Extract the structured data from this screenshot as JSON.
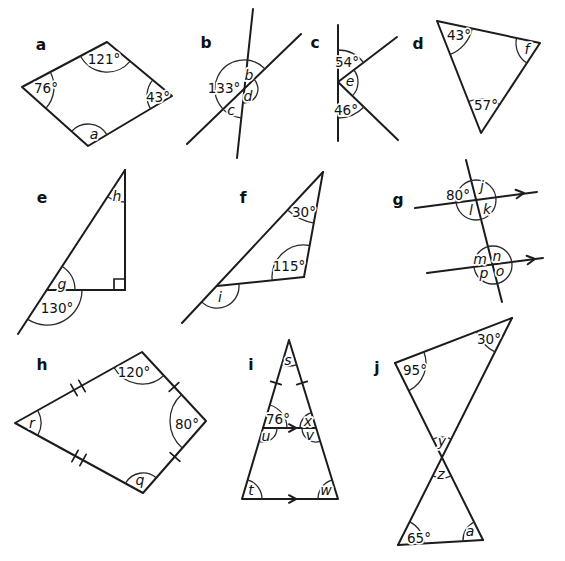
{
  "colors": {
    "ink": "#1c1c1c",
    "background": "#ffffff"
  },
  "figures": {
    "a": {
      "label": "a",
      "angles": {
        "top": "121°",
        "left": "76°",
        "right": "43°",
        "bottom": "a"
      }
    },
    "b": {
      "label": "b",
      "angles": {
        "top": "b",
        "left": "133°",
        "right": "d",
        "bottom": "c"
      }
    },
    "c": {
      "label": "c",
      "angles": {
        "top": "54°",
        "middle": "e",
        "bottom": "46°"
      }
    },
    "d": {
      "label": "d",
      "angles": {
        "top_left": "43°",
        "right": "f",
        "bottom": "57°"
      }
    },
    "e": {
      "label": "e",
      "angles": {
        "top": "h",
        "base_inner": "g",
        "base_outer": "130°"
      }
    },
    "f": {
      "label": "f",
      "angles": {
        "apex": "30°",
        "inner_right": "115°",
        "exterior_left": "i"
      }
    },
    "g": {
      "label": "g",
      "angles": {
        "top_tl": "80°",
        "top_tr": "j",
        "top_bl": "l",
        "top_br": "k",
        "bot_tl": "m",
        "bot_tr": "n",
        "bot_bl": "p",
        "bot_br": "o"
      }
    },
    "h": {
      "label": "h",
      "angles": {
        "top": "120°",
        "left": "r",
        "right": "80°",
        "bottom": "q"
      }
    },
    "i": {
      "label": "i",
      "angles": {
        "apex": "s",
        "mid_left_above": "76°",
        "mid_left_below": "u",
        "mid_right_above": "x",
        "mid_right_below": "v",
        "base_left": "t",
        "base_right": "w"
      }
    },
    "j": {
      "label": "j",
      "angles": {
        "top_right": "30°",
        "top_left": "95°",
        "cross_upper": "y",
        "cross_lower": "z",
        "bottom_left": "65°",
        "bottom_right": "a"
      }
    }
  }
}
